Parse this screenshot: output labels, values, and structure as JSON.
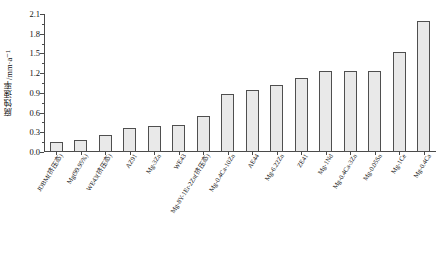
{
  "chart_data": {
    "type": "bar",
    "title": "",
    "xlabel": "",
    "ylabel": "腐蚀速率/mm·a⁻¹",
    "ylim": [
      0.0,
      2.1
    ],
    "yticks": [
      0.0,
      0.3,
      0.6,
      0.9,
      1.2,
      1.5,
      1.8,
      2.1
    ],
    "ytick_labels": [
      "0.0",
      "0.3",
      "0.6",
      "0.9",
      "1.2",
      "1.5",
      "1.8",
      "2.1"
    ],
    "grid": false,
    "legend": "none",
    "bar_face_color": "#e9e9e9",
    "bar_edge_color": "#4f4f4f",
    "axis_color": "#4a4a4a",
    "categories": [
      "JDBM(挤压态)",
      "Mg(99.95%)",
      "WE43(挤压态)",
      "AZ91",
      "Mg-3Zn",
      "WE43",
      "Mg-8Y-1Er-2Zn(挤压态)",
      "Mg-0.4Ca-10Zn",
      "AE44",
      "Mg-6.22Zn",
      "ZE41",
      "Mg-1Nd",
      "Mg-0.4Ca-3Zn",
      "Mg-0.05Sn",
      "Mg-1Ce",
      "Mg-0.4Ca"
    ],
    "values": [
      0.15,
      0.18,
      0.26,
      0.36,
      0.4,
      0.41,
      0.55,
      0.88,
      0.95,
      1.02,
      1.13,
      1.24,
      1.23,
      1.24,
      1.52,
      2.0
    ]
  }
}
